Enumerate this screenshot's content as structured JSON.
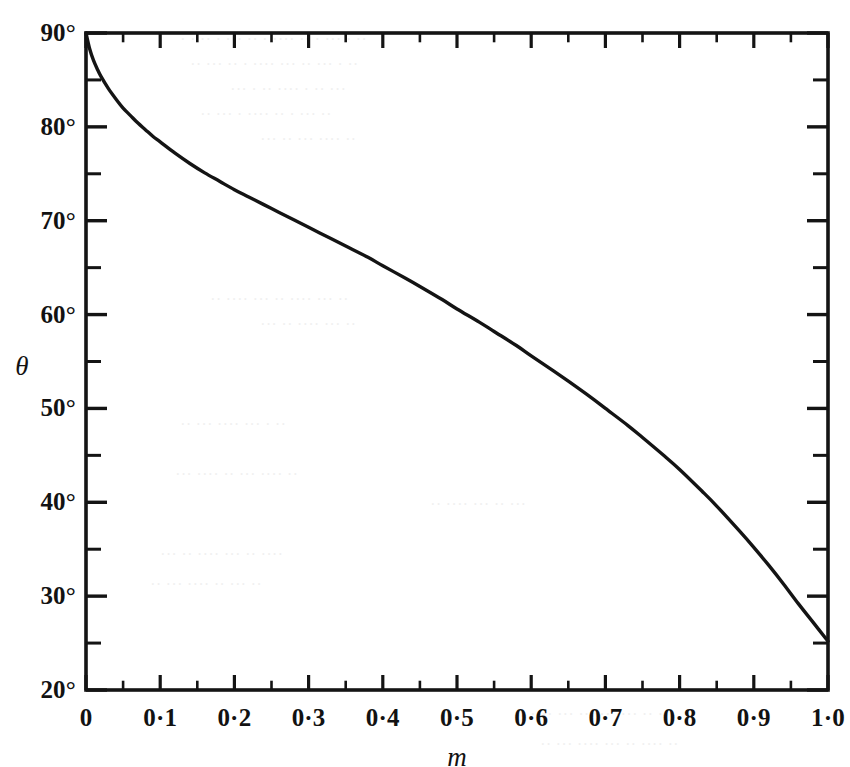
{
  "chart_data": {
    "type": "line",
    "title": "",
    "subtitle": "",
    "xlabel": "m",
    "ylabel": "θ",
    "xlim": [
      0,
      1.0
    ],
    "ylim": [
      20,
      90
    ],
    "grid": false,
    "legend": null,
    "annotations": [],
    "x_tick_labels": [
      "0",
      "0·1",
      "0·2",
      "0·3",
      "0·4",
      "0·5",
      "0·6",
      "0·7",
      "0·8",
      "0·9",
      "1·0"
    ],
    "x_tick_values": [
      0,
      0.1,
      0.2,
      0.3,
      0.4,
      0.5,
      0.6,
      0.7,
      0.8,
      0.9,
      1.0
    ],
    "x_minor_step": 0.05,
    "y_tick_labels": [
      "20°",
      "30°",
      "40°",
      "50°",
      "60°",
      "70°",
      "80°",
      "90°"
    ],
    "y_tick_values": [
      20,
      30,
      40,
      50,
      60,
      70,
      80,
      90
    ],
    "y_minor_step": 5,
    "series": [
      {
        "name": "theta-vs-m",
        "color": "#141414",
        "x": [
          0,
          0.005,
          0.01,
          0.015,
          0.02,
          0.03,
          0.04,
          0.05,
          0.06,
          0.07,
          0.08,
          0.09,
          0.1,
          0.12,
          0.14,
          0.16,
          0.18,
          0.2,
          0.22,
          0.25,
          0.28,
          0.3,
          0.33,
          0.35,
          0.38,
          0.4,
          0.43,
          0.45,
          0.48,
          0.5,
          0.53,
          0.55,
          0.58,
          0.6,
          0.63,
          0.65,
          0.68,
          0.7,
          0.73,
          0.75,
          0.78,
          0.8,
          0.83,
          0.85,
          0.88,
          0.9,
          0.92,
          0.94,
          0.96,
          0.98,
          1.0
        ],
        "y": [
          90.0,
          88.3,
          87.1,
          86.2,
          85.4,
          84.1,
          83.0,
          82.0,
          81.2,
          80.4,
          79.7,
          79.0,
          78.4,
          77.2,
          76.1,
          75.1,
          74.2,
          73.3,
          72.5,
          71.3,
          70.1,
          69.3,
          68.1,
          67.3,
          66.1,
          65.2,
          63.9,
          63.0,
          61.6,
          60.6,
          59.2,
          58.2,
          56.7,
          55.6,
          54.0,
          52.9,
          51.2,
          50.0,
          48.2,
          46.9,
          44.9,
          43.5,
          41.2,
          39.6,
          37.0,
          35.2,
          33.3,
          31.3,
          29.2,
          27.2,
          25.2
        ]
      }
    ]
  },
  "axes": {
    "y_title": "θ",
    "x_title": "m"
  },
  "background_bleed": [
    {
      "text": "· ·  ··  · ··· ··  · ····  ·· ·  ··· · ··",
      "x": 180,
      "y": 30
    },
    {
      "text": "·· ···  ·· ·  ···· ···  ·· ··· · ··",
      "x": 190,
      "y": 55
    },
    {
      "text": "··· · ··  ···· · ·· ···",
      "x": 230,
      "y": 80
    },
    {
      "text": "·· ··· · ···· ·· · ··· ··",
      "x": 200,
      "y": 105
    },
    {
      "text": "··· ·· ··· ···· ··",
      "x": 260,
      "y": 130
    },
    {
      "text": "·· ···· ··· ·· ···· ··· ··",
      "x": 210,
      "y": 290
    },
    {
      "text": "··· ·· ···· ··· ··",
      "x": 260,
      "y": 315
    },
    {
      "text": "·· ··· ···· ··· · ··",
      "x": 180,
      "y": 415
    },
    {
      "text": "··· ···· ·· ··· ···· ··",
      "x": 175,
      "y": 465
    },
    {
      "text": "·· ···· ··· ·· ···",
      "x": 430,
      "y": 495
    },
    {
      "text": "··· ·· ···· ··· ·· ····",
      "x": 160,
      "y": 545
    },
    {
      "text": "·· ··· ···· ·· ··· ··",
      "x": 150,
      "y": 575
    },
    {
      "text": "···· ··· ·· ··· ···· ·· ···",
      "x": 530,
      "y": 705
    },
    {
      "text": "·· ··· ···· ··· ·· ···· ··",
      "x": 540,
      "y": 735
    }
  ]
}
